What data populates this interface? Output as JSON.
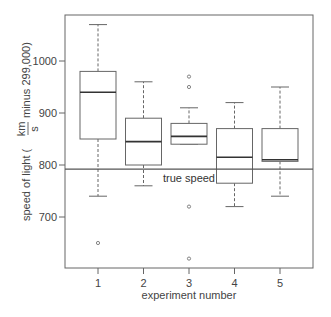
{
  "chart_data": {
    "type": "box",
    "title": "",
    "xlabel": "experiment number",
    "ylabel": {
      "prefix": "speed of light (",
      "fraction_numerator": "km",
      "fraction_denominator": "s",
      "suffix": "minus 299,000)"
    },
    "categories": [
      "1",
      "2",
      "3",
      "4",
      "5"
    ],
    "ylim": [
      600,
      1085
    ],
    "yticks": [
      700,
      800,
      900,
      1000
    ],
    "grid": false,
    "legend": null,
    "series": [
      {
        "name": "1",
        "whisker_low": 740,
        "q1": 850,
        "median": 940,
        "q3": 980,
        "whisker_high": 1070,
        "outliers": [
          650
        ]
      },
      {
        "name": "2",
        "whisker_low": 760,
        "q1": 800,
        "median": 845,
        "q3": 890,
        "whisker_high": 960,
        "outliers": []
      },
      {
        "name": "3",
        "whisker_low": 840,
        "q1": 840,
        "median": 855,
        "q3": 880,
        "whisker_high": 910,
        "outliers": [
          970,
          950,
          720,
          620
        ]
      },
      {
        "name": "4",
        "whisker_low": 720,
        "q1": 765,
        "median": 815,
        "q3": 870,
        "whisker_high": 920,
        "outliers": []
      },
      {
        "name": "5",
        "whisker_low": 740,
        "q1": 807,
        "median": 810,
        "q3": 870,
        "whisker_high": 950,
        "outliers": []
      }
    ],
    "reference_line": {
      "value": 792,
      "label": "true speed"
    },
    "colors": {
      "box": "#666666",
      "median": "#333333",
      "reference": "#555555",
      "axis": "#666666"
    }
  }
}
